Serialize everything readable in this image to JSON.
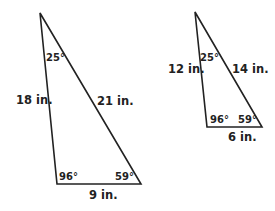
{
  "triangles": [
    {
      "name": "large",
      "angles": {
        "top": "25°",
        "bottom_left": "96°",
        "bottom_right": "59°"
      },
      "sides": {
        "left": "18 in.",
        "right": "21 in.",
        "bottom": "9 in."
      }
    },
    {
      "name": "small",
      "angles": {
        "top": "25°",
        "bottom_left": "96°",
        "bottom_right": "59°"
      },
      "sides": {
        "left": "12 in.",
        "right": "14 in.",
        "bottom": "6 in."
      }
    }
  ]
}
